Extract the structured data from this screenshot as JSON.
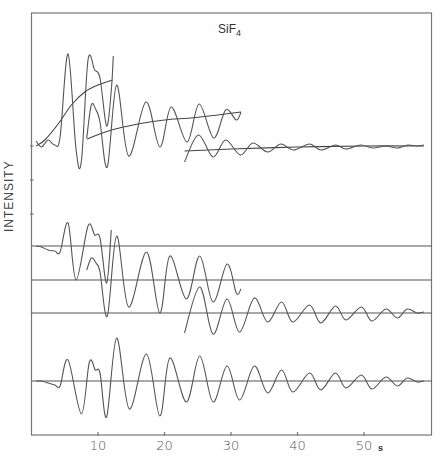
{
  "chart_data": {
    "type": "line",
    "title": "SiF4",
    "title_main": "SiF",
    "title_sub": "4",
    "xlabel": "s",
    "ylabel": "INTENSITY",
    "xlim": [
      0,
      59.5
    ],
    "x_ticks": [
      10,
      20,
      30,
      40,
      50
    ],
    "x_tick_labels": [
      "10",
      "20",
      "30",
      "40",
      "50"
    ],
    "grid": false,
    "legend": null,
    "y_ticks_px": [
      146,
      180,
      214
    ],
    "px_map": {
      "x0": 31.5,
      "x_per_unit": 6.65
    },
    "series": [
      {
        "name": "top-segment-1 (raw, s 0.7-12.3)",
        "baseline_fit": [
          [
            0.7,
            146
          ],
          [
            2,
            140
          ],
          [
            4,
            124
          ],
          [
            6,
            105
          ],
          [
            8,
            92
          ],
          [
            10,
            85
          ],
          [
            12.2,
            80
          ]
        ],
        "points": [
          [
            0.7,
            141
          ],
          [
            1.5,
            147
          ],
          [
            2.5,
            140
          ],
          [
            3.5,
            145
          ],
          [
            4.3,
            137
          ],
          [
            5.5,
            54
          ],
          [
            6.7,
            150
          ],
          [
            7.5,
            161
          ],
          [
            8.5,
            60
          ],
          [
            9.5,
            70
          ],
          [
            10.3,
            78
          ],
          [
            11.3,
            126
          ],
          [
            12,
            90
          ],
          [
            12.3,
            56
          ]
        ]
      },
      {
        "name": "top-segment-2 (raw, s 8.3-31.5)",
        "baseline_fit": [
          [
            8.3,
            139
          ],
          [
            12,
            130
          ],
          [
            16,
            124
          ],
          [
            20,
            120
          ],
          [
            24,
            118
          ],
          [
            28,
            115
          ],
          [
            31.5,
            112
          ]
        ],
        "points": [
          [
            8.3,
            138
          ],
          [
            9,
            105
          ],
          [
            9.7,
            110
          ],
          [
            10.3,
            122
          ],
          [
            11.4,
            167
          ],
          [
            12.8,
            85
          ],
          [
            14.6,
            156
          ],
          [
            17.2,
            102
          ],
          [
            19.3,
            147
          ],
          [
            21,
            107
          ],
          [
            23.4,
            142
          ],
          [
            25.2,
            104
          ],
          [
            27.4,
            138
          ],
          [
            29.2,
            110
          ],
          [
            30.8,
            120
          ],
          [
            31.5,
            112
          ]
        ]
      },
      {
        "name": "top-segment-3 (raw, s 23-59)",
        "baseline_fit": [
          [
            23,
            151
          ],
          [
            30,
            149
          ],
          [
            40,
            147
          ],
          [
            50,
            146
          ],
          [
            59,
            146
          ]
        ],
        "points": [
          [
            23,
            162
          ],
          [
            25.1,
            135
          ],
          [
            27.3,
            157
          ],
          [
            29.2,
            140
          ],
          [
            31.4,
            155
          ],
          [
            33.3,
            143
          ],
          [
            35.5,
            152
          ],
          [
            37.5,
            144
          ],
          [
            39.4,
            150
          ],
          [
            41.8,
            144
          ],
          [
            43.5,
            150
          ],
          [
            45.7,
            145
          ],
          [
            47.3,
            149
          ],
          [
            49.5,
            145
          ],
          [
            51.3,
            148
          ],
          [
            53.3,
            146
          ],
          [
            55,
            148
          ],
          [
            56.6,
            145
          ],
          [
            58,
            146
          ],
          [
            59,
            145
          ]
        ]
      },
      {
        "name": "middle-1 (s 0.7-12)",
        "baseline_px": 246,
        "points": [
          [
            0.7,
            246
          ],
          [
            1.5,
            247
          ],
          [
            2.5,
            250
          ],
          [
            3.5,
            251
          ],
          [
            4.3,
            252
          ],
          [
            5.5,
            223
          ],
          [
            6.7,
            280
          ],
          [
            8.5,
            226
          ],
          [
            9.5,
            235
          ],
          [
            10.3,
            238
          ],
          [
            11.3,
            283
          ],
          [
            12,
            230
          ]
        ]
      },
      {
        "name": "middle-2 (s 8.3-31.5)",
        "baseline_px": 280,
        "points": [
          [
            8.3,
            270
          ],
          [
            9,
            258
          ],
          [
            9.7,
            263
          ],
          [
            10.3,
            272
          ],
          [
            11.4,
            316
          ],
          [
            12.8,
            236
          ],
          [
            14.6,
            307
          ],
          [
            17.3,
            252
          ],
          [
            19.3,
            313
          ],
          [
            20.8,
            256
          ],
          [
            23.3,
            299
          ],
          [
            25.3,
            256
          ],
          [
            27.3,
            302
          ],
          [
            29.4,
            264
          ],
          [
            30.8,
            293
          ],
          [
            31.5,
            289
          ]
        ]
      },
      {
        "name": "middle-3 (s 23-59)",
        "baseline_px": 313,
        "points": [
          [
            23,
            333
          ],
          [
            25.3,
            287
          ],
          [
            27.3,
            334
          ],
          [
            29.4,
            299
          ],
          [
            31.3,
            332
          ],
          [
            33.5,
            298
          ],
          [
            35.5,
            322
          ],
          [
            37.6,
            302
          ],
          [
            39.3,
            322
          ],
          [
            41.8,
            305
          ],
          [
            43.5,
            323
          ],
          [
            45.7,
            306
          ],
          [
            47.3,
            320
          ],
          [
            49.6,
            307
          ],
          [
            51.2,
            321
          ],
          [
            53.3,
            309
          ],
          [
            55,
            318
          ],
          [
            56.5,
            309
          ],
          [
            58,
            313
          ],
          [
            59,
            312
          ]
        ]
      },
      {
        "name": "combined (s 0.7-59)",
        "baseline_px": 381,
        "points": [
          [
            0.7,
            381
          ],
          [
            1.5,
            381
          ],
          [
            2.5,
            383
          ],
          [
            3.5,
            385
          ],
          [
            4.3,
            386
          ],
          [
            5.5,
            360
          ],
          [
            7.5,
            414
          ],
          [
            8.7,
            362
          ],
          [
            9.6,
            370
          ],
          [
            10.3,
            373
          ],
          [
            11.3,
            417
          ],
          [
            12.8,
            338
          ],
          [
            14.7,
            409
          ],
          [
            17.3,
            354
          ],
          [
            19.3,
            416
          ],
          [
            20.8,
            358
          ],
          [
            23.3,
            402
          ],
          [
            25.3,
            356
          ],
          [
            27.3,
            402
          ],
          [
            29.4,
            366
          ],
          [
            31.3,
            400
          ],
          [
            33.5,
            366
          ],
          [
            35.5,
            393
          ],
          [
            37.6,
            370
          ],
          [
            39.3,
            392
          ],
          [
            41.8,
            373
          ],
          [
            43.5,
            390
          ],
          [
            45.7,
            373
          ],
          [
            47.3,
            388
          ],
          [
            49.6,
            375
          ],
          [
            51.2,
            389
          ],
          [
            53.3,
            377
          ],
          [
            55,
            386
          ],
          [
            56.5,
            378
          ],
          [
            58,
            382
          ],
          [
            59,
            381
          ]
        ]
      }
    ],
    "horizontal_baselines_px": [
      246,
      280,
      313,
      381
    ]
  }
}
